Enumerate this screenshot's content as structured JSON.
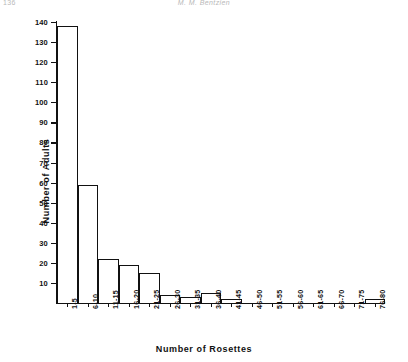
{
  "runhead": {
    "folio": "136",
    "title": "M. M. Bentzien"
  },
  "chart_data": {
    "type": "bar",
    "title": "",
    "xlabel": "Number of Rosettes",
    "ylabel": "Number of Adults",
    "categories": [
      "1-5",
      "6-10",
      "11-15",
      "16-20",
      "21-25",
      "26-30",
      "31-35",
      "36-40",
      "41-45",
      "46-50",
      "51-55",
      "56-60",
      "61-65",
      "66-70",
      "71-75",
      "76-80"
    ],
    "values": [
      138,
      59,
      22,
      19,
      15,
      4,
      3,
      5,
      2,
      0,
      0,
      0,
      0,
      0,
      0,
      2
    ],
    "yticks": [
      10,
      20,
      30,
      40,
      50,
      60,
      70,
      80,
      90,
      100,
      110,
      120,
      130,
      140
    ],
    "ylim": [
      0,
      140
    ],
    "grid": false,
    "legend": null,
    "bar_fill": "#ffffff",
    "bar_edge": "#111111"
  }
}
